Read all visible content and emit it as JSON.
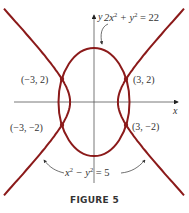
{
  "figure": {
    "caption": "FIGURE 5",
    "axis_labels": {
      "x": "x",
      "y": "y"
    },
    "curve_color": "#8b1a1a",
    "ellipse": {
      "equation": "2x² + y² = 22",
      "label_parts": [
        "2x",
        "2",
        " + y",
        "2",
        " = 22"
      ]
    },
    "hyperbola": {
      "equation": "x² − y² = 5",
      "label_parts": [
        "x",
        "2",
        " − y",
        "2",
        " = 5"
      ]
    },
    "points": [
      {
        "label": "(−3, 2)",
        "x": -3,
        "y": 2
      },
      {
        "label": "(3, 2)",
        "x": 3,
        "y": 2
      },
      {
        "label": "(−3, −2)",
        "x": -3,
        "y": -2
      },
      {
        "label": "(3, −2)",
        "x": 3,
        "y": -2
      }
    ]
  },
  "chart_data": {
    "type": "line",
    "title": "FIGURE 5",
    "xlabel": "x",
    "ylabel": "y",
    "series": [
      {
        "name": "2x^2 + y^2 = 22",
        "kind": "ellipse",
        "semi_axes": {
          "x": 3.317,
          "y": 4.69
        }
      },
      {
        "name": "x^2 - y^2 = 5",
        "kind": "hyperbola",
        "vertices": [
          [
            -2.236,
            0
          ],
          [
            2.236,
            0
          ]
        ]
      }
    ],
    "intersections": [
      [
        -3,
        2
      ],
      [
        3,
        2
      ],
      [
        -3,
        -2
      ],
      [
        3,
        -2
      ]
    ],
    "grid": false
  }
}
